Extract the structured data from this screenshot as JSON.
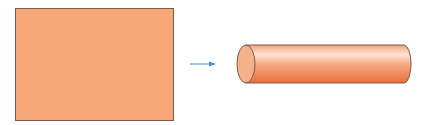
{
  "diagram": {
    "sheet": {
      "fill": "#f7a777",
      "stroke": "#7a5a4a"
    },
    "arrow": {
      "color": "#4a90d0"
    },
    "cylinder": {
      "light": "#fde4d6",
      "mid": "#f6a47a",
      "dark": "#e8703e",
      "cap": "#f5b08c",
      "stroke": "#7a5a4a"
    }
  }
}
